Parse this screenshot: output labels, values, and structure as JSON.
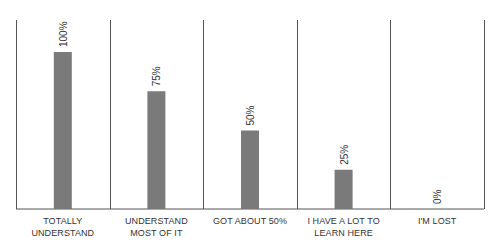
{
  "chart_data": {
    "type": "bar",
    "title": "",
    "xlabel": "",
    "ylabel": "",
    "categories": [
      "TOTALLY UNDERSTAND",
      "UNDERSTAND MOST OF IT",
      "GOT ABOUT 50%",
      "I HAVE A LOT TO LEARN HERE",
      "I'M LOST"
    ],
    "category_lines": [
      [
        "TOTALLY",
        "UNDERSTAND"
      ],
      [
        "UNDERSTAND",
        "MOST OF IT"
      ],
      [
        "GOT ABOUT 50%"
      ],
      [
        "I HAVE A LOT TO",
        "LEARN HERE"
      ],
      [
        "I'M LOST"
      ]
    ],
    "values": [
      100,
      75,
      50,
      25,
      0
    ],
    "value_labels": [
      "100%",
      "75%",
      "50%",
      "25%",
      "0%"
    ],
    "ylim": [
      0,
      100
    ],
    "grid": false,
    "legend": null,
    "bar_color": "#7a7a7a",
    "line_color": "#555555",
    "label_color": "#333333"
  }
}
